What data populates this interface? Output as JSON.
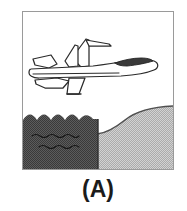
{
  "figure": {
    "caption": "(A)",
    "panel_label": "A",
    "scene_description": "Jet aircraft in flight above a shoreline",
    "frame": {
      "border_color": "#9a9a9a",
      "background_color": "#ffffff",
      "x": 22,
      "y": 11,
      "width": 152,
      "height": 159
    },
    "elements": {
      "aircraft": {
        "name": "jet-fighter",
        "orientation": "nose-right",
        "outline_color": "#2b2b2b",
        "body_fill": "#ffffff",
        "canopy_fill": "#3a3a3a",
        "parts": [
          "fuselage",
          "cockpit-canopy",
          "nose-cone",
          "vertical-stabilizer",
          "horizontal-stabilizer",
          "main-wing",
          "wing-pylon",
          "tail-fin"
        ]
      },
      "water": {
        "name": "sea",
        "fill_color": "#4a4a4a",
        "texture": "halftone-dither",
        "top_edge": "scalloped-waves",
        "wave_count": 3,
        "ripple_rows": 2,
        "region": "left"
      },
      "land": {
        "name": "hill",
        "fill_color": "#c3c3c3",
        "texture": "halftone-dither",
        "outline_color": "#4a4a4a",
        "shape": "rising-curve",
        "region": "right"
      }
    }
  }
}
